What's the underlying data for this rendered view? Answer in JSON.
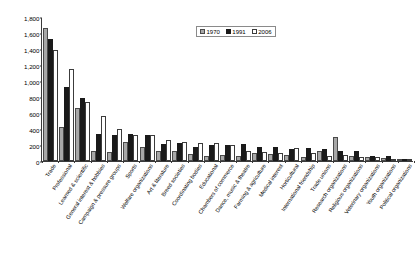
{
  "chart_data": {
    "type": "bar",
    "title": "",
    "xlabel": "",
    "ylabel": "Number of associations",
    "ylim": [
      0,
      1800
    ],
    "ytick_step": 200,
    "yticks": [
      "0",
      "200",
      "400",
      "600",
      "800",
      "1,000",
      "1,200",
      "1,400",
      "1,600",
      "1,800"
    ],
    "grid": false,
    "legend_position": "top-center",
    "categories": [
      "Trade",
      "Professional",
      "Learned & scientific",
      "General interest & hobbies",
      "Campaign & pressure groups",
      "Sports",
      "Welfare organizations",
      "Art & literature",
      "Breed societies",
      "Coordinating bodies",
      "Educational",
      "Chambers of commerce",
      "Dance, music & theatre",
      "Farming & agriculture",
      "Medical interest",
      "Horticultural",
      "International friendship",
      "Trade unions",
      "Research organizations",
      "Religious organizations",
      "Veterinary organizations",
      "Youth organizations",
      "Political organizations"
    ],
    "series": [
      {
        "name": "1970",
        "color": "#a8a8a8",
        "values": [
          1660,
          430,
          660,
          120,
          110,
          240,
          170,
          130,
          120,
          90,
          60,
          70,
          60,
          100,
          90,
          80,
          55,
          130,
          300,
          60,
          55,
          40,
          20
        ]
      },
      {
        "name": "1991",
        "color": "#1a1a1a",
        "values": [
          1520,
          920,
          790,
          340,
          320,
          340,
          330,
          210,
          230,
          170,
          200,
          200,
          215,
          180,
          170,
          150,
          160,
          150,
          120,
          130,
          60,
          60,
          25
        ]
      },
      {
        "name": "2006",
        "color": "#ffffff",
        "values": [
          1390,
          1150,
          740,
          560,
          400,
          330,
          325,
          260,
          240,
          225,
          230,
          195,
          130,
          110,
          100,
          160,
          95,
          60,
          75,
          45,
          50,
          30,
          20
        ]
      }
    ]
  },
  "legend": {
    "items": [
      {
        "label": "1970"
      },
      {
        "label": "1991"
      },
      {
        "label": "2006"
      }
    ]
  }
}
